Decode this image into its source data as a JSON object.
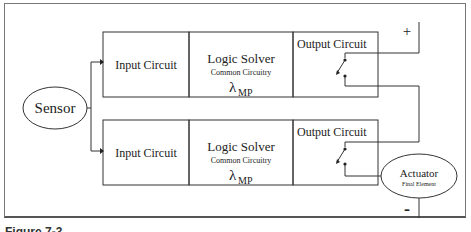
{
  "diagram": {
    "sensor": {
      "label": "Sensor"
    },
    "channels": [
      {
        "input": "Input Circuit",
        "logic": {
          "title": "Logic Solver",
          "subtitle": "Common Circuitry",
          "symbol": "λ",
          "symbol_sub": "MP"
        },
        "output": "Output Circuit"
      },
      {
        "input": "Input Circuit",
        "logic": {
          "title": "Logic Solver",
          "subtitle": "Common Circuitry",
          "symbol": "λ",
          "symbol_sub": "MP"
        },
        "output": "Output Circuit"
      }
    ],
    "actuator": {
      "label": "Actuator",
      "sublabel": "Final Element"
    },
    "terminals": {
      "positive": "+",
      "negative": "-"
    }
  },
  "caption": "Figure 7-3 ..."
}
